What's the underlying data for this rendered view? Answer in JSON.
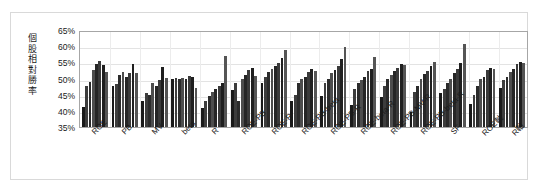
{
  "chart_data": {
    "type": "bar",
    "title": "",
    "xlabel": "",
    "ylabel": "個股相對勝率",
    "ylim": [
      0.35,
      0.65
    ],
    "ytick_labels": [
      "65%",
      "60%",
      "55%",
      "50%",
      "45%",
      "40%",
      "35%"
    ],
    "ytick_values": [
      0.65,
      0.6,
      0.55,
      0.5,
      0.45,
      0.4,
      0.35
    ],
    "grid": true,
    "legend": "none",
    "categories": [
      "ROE",
      "PB",
      "MV",
      "beta",
      "R",
      "ROE-PB",
      "ROE-R",
      "ROE-PB-beta",
      "ROE-PB-R",
      "ROE-beta-R",
      "ROE-PB-MV-R",
      "ROE-PB-beta-R",
      "SF",
      "ROE軸",
      "R軸"
    ],
    "bars_per_group": 8,
    "groups": [
      {
        "label": "ROE",
        "values": [
          0.413,
          0.478,
          0.49,
          0.527,
          0.545,
          0.553,
          0.543,
          0.52
        ]
      },
      {
        "label": "PB",
        "values": [
          0.478,
          0.483,
          0.51,
          0.52,
          0.505,
          0.516,
          0.546,
          0.518
        ]
      },
      {
        "label": "MV",
        "values": [
          0.43,
          0.455,
          0.448,
          0.487,
          0.478,
          0.494,
          0.536,
          0.502
        ]
      },
      {
        "label": "beta",
        "values": [
          0.5,
          0.502,
          0.5,
          0.503,
          0.499,
          0.508,
          0.506,
          0.472
        ]
      },
      {
        "label": "R",
        "values": [
          0.408,
          0.43,
          0.445,
          0.458,
          0.468,
          0.478,
          0.486,
          0.571
        ]
      },
      {
        "label": "ROE-PB",
        "values": [
          0.465,
          0.487,
          0.43,
          0.498,
          0.51,
          0.527,
          0.534,
          0.509
        ]
      },
      {
        "label": "ROE-R",
        "values": [
          0.487,
          0.505,
          0.52,
          0.529,
          0.54,
          0.548,
          0.562,
          0.589
        ]
      },
      {
        "label": "ROE-PB-beta",
        "values": [
          0.43,
          0.448,
          0.487,
          0.497,
          0.506,
          0.52,
          0.528,
          0.522
        ]
      },
      {
        "label": "ROE-PB-R",
        "values": [
          0.446,
          0.487,
          0.497,
          0.516,
          0.527,
          0.54,
          0.559,
          0.599
        ]
      },
      {
        "label": "ROE-beta-R",
        "values": [
          0.418,
          0.468,
          0.487,
          0.494,
          0.506,
          0.524,
          0.53,
          0.566
        ]
      },
      {
        "label": "ROE-PB-MV-R",
        "values": [
          0.444,
          0.478,
          0.497,
          0.512,
          0.522,
          0.534,
          0.544,
          0.541
        ]
      },
      {
        "label": "ROE-PB-beta-R",
        "values": [
          0.396,
          0.458,
          0.478,
          0.5,
          0.513,
          0.524,
          0.538,
          0.551
        ]
      },
      {
        "label": "SF",
        "values": [
          0.455,
          0.468,
          0.487,
          0.5,
          0.516,
          0.529,
          0.548,
          0.608
        ]
      },
      {
        "label": "ROE軸",
        "values": [
          0.422,
          0.45,
          0.478,
          0.5,
          0.506,
          0.525,
          0.534,
          0.53
        ]
      },
      {
        "label": "R軸",
        "values": [
          0.47,
          0.495,
          0.506,
          0.521,
          0.53,
          0.544,
          0.552,
          0.549
        ]
      }
    ],
    "bar_colors": [
      "#1a1a1a",
      "#3d3d3d",
      "#2b2b2b",
      "#4d4d4d",
      "#262626",
      "#3a3a3a",
      "#1f1f1f",
      "#555555"
    ],
    "plot_border_color": "#a6a6a6",
    "gridline_color": "#e3e3e3",
    "figure_border_color": "#d9d9d9"
  }
}
